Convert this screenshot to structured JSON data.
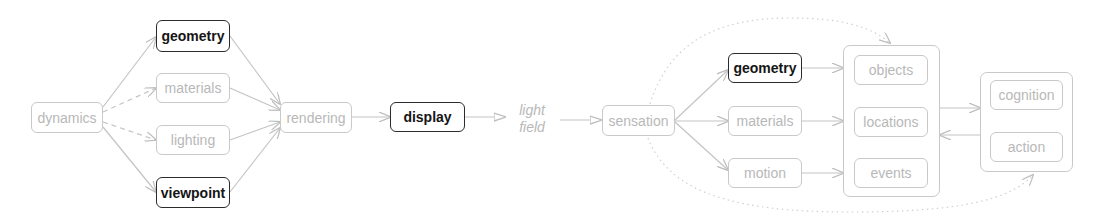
{
  "diagram": {
    "left_pipeline": {
      "nodes": [
        {
          "id": "dynamics",
          "label": "dynamics",
          "emphasis": false
        },
        {
          "id": "geometry",
          "label": "geometry",
          "emphasis": true
        },
        {
          "id": "materials",
          "label": "materials",
          "emphasis": false
        },
        {
          "id": "lighting",
          "label": "lighting",
          "emphasis": false
        },
        {
          "id": "viewpoint",
          "label": "viewpoint",
          "emphasis": true
        },
        {
          "id": "rendering",
          "label": "rendering",
          "emphasis": false
        },
        {
          "id": "display",
          "label": "display",
          "emphasis": true
        }
      ],
      "edges": [
        {
          "from": "dynamics",
          "to": "geometry",
          "style": "solid"
        },
        {
          "from": "dynamics",
          "to": "materials",
          "style": "dashed"
        },
        {
          "from": "dynamics",
          "to": "lighting",
          "style": "dashed"
        },
        {
          "from": "dynamics",
          "to": "viewpoint",
          "style": "solid"
        },
        {
          "from": "geometry",
          "to": "rendering",
          "style": "solid"
        },
        {
          "from": "materials",
          "to": "rendering",
          "style": "solid"
        },
        {
          "from": "lighting",
          "to": "rendering",
          "style": "solid"
        },
        {
          "from": "viewpoint",
          "to": "rendering",
          "style": "solid"
        },
        {
          "from": "rendering",
          "to": "display",
          "style": "solid"
        },
        {
          "from": "display",
          "to": "light_field",
          "style": "open-triangle"
        }
      ]
    },
    "middle": {
      "light_field_line1": "light",
      "light_field_line2": "field"
    },
    "right_pipeline": {
      "nodes": [
        {
          "id": "sensation",
          "label": "sensation",
          "emphasis": false
        },
        {
          "id": "geometry2",
          "label": "geometry",
          "emphasis": true
        },
        {
          "id": "materials2",
          "label": "materials",
          "emphasis": false
        },
        {
          "id": "motion",
          "label": "motion",
          "emphasis": false
        }
      ],
      "group_world": [
        {
          "id": "objects",
          "label": "objects"
        },
        {
          "id": "locations",
          "label": "locations"
        },
        {
          "id": "events",
          "label": "events"
        }
      ],
      "group_mind": [
        {
          "id": "cognition",
          "label": "cognition"
        },
        {
          "id": "action",
          "label": "action"
        }
      ],
      "edges": [
        {
          "from": "light_field",
          "to": "sensation",
          "style": "open-triangle"
        },
        {
          "from": "sensation",
          "to": "geometry2",
          "style": "solid"
        },
        {
          "from": "sensation",
          "to": "materials2",
          "style": "solid"
        },
        {
          "from": "sensation",
          "to": "motion",
          "style": "solid"
        },
        {
          "from": "geometry2",
          "to": "objects",
          "style": "solid"
        },
        {
          "from": "materials2",
          "to": "locations",
          "style": "solid"
        },
        {
          "from": "motion",
          "to": "events",
          "style": "solid"
        },
        {
          "from": "group_world",
          "to": "group_mind",
          "style": "solid"
        },
        {
          "from": "group_mind",
          "to": "group_world",
          "style": "solid"
        },
        {
          "from": "sensation",
          "to": "group_world",
          "style": "dotted-curve"
        },
        {
          "from": "sensation",
          "to": "group_mind",
          "style": "dotted-curve"
        }
      ]
    },
    "colors": {
      "light_stroke": "#c9c9c9",
      "light_text": "#b8b8b8",
      "bold_stroke": "#2b2b2b",
      "bold_text": "#151515"
    }
  }
}
